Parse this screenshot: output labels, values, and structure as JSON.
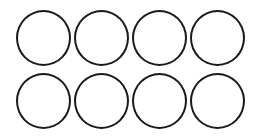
{
  "figure": {
    "rows": 2,
    "columns": 4,
    "shape": "circle",
    "fill_color": "#ffffff",
    "stroke_color": "#1a1a1a",
    "circles": [
      {
        "row": 1,
        "col": 1
      },
      {
        "row": 1,
        "col": 2
      },
      {
        "row": 1,
        "col": 3
      },
      {
        "row": 1,
        "col": 4
      },
      {
        "row": 2,
        "col": 1
      },
      {
        "row": 2,
        "col": 2
      },
      {
        "row": 2,
        "col": 3
      },
      {
        "row": 2,
        "col": 4
      }
    ]
  }
}
